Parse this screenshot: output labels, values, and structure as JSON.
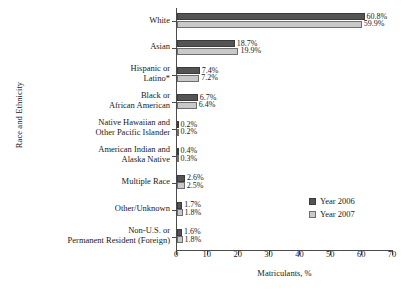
{
  "chart_data": {
    "type": "bar",
    "orientation": "horizontal",
    "title": "",
    "xlabel": "Matriculants, %",
    "ylabel": "Race and Ethnicity",
    "xlim": [
      0,
      70
    ],
    "xticks": [
      0,
      10,
      20,
      30,
      40,
      50,
      60,
      70
    ],
    "grid": false,
    "legend_position": "inside-right",
    "categories": [
      "White",
      "Asian",
      "Hispanic or\nLatino*",
      "Black or\nAfrican American",
      "Native Hawaiian and\nOther Pacific Islander",
      "American Indian and\nAlaska Native",
      "Multiple Race",
      "Other/Unknown",
      "Non-U.S. or\nPermanent Resident (Foreign)"
    ],
    "series": [
      {
        "name": "Year 2006",
        "color": "#545454",
        "values": [
          60.8,
          18.7,
          7.4,
          6.7,
          0.2,
          0.4,
          2.6,
          1.7,
          1.6
        ],
        "labels": [
          "60.8%",
          "18.7%",
          "7.4%",
          "6.7%",
          "0.2%",
          "0.4%",
          "2.6%",
          "1.7%",
          "1.6%"
        ]
      },
      {
        "name": "Year 2007",
        "color": "#c9c9c9",
        "values": [
          59.9,
          19.9,
          7.2,
          6.4,
          0.2,
          0.3,
          2.5,
          1.8,
          1.8
        ],
        "labels": [
          "59.9%",
          "19.9%",
          "7.2%",
          "6.4%",
          "0.2%",
          "0.3%",
          "2.5%",
          "1.8%",
          "1.8%"
        ]
      }
    ]
  },
  "legend": {
    "items": [
      {
        "label": "Year 2006"
      },
      {
        "label": "Year 2007"
      }
    ]
  },
  "axes": {
    "x_title": "Matriculants, %",
    "y_title": "Race and Ethnicity",
    "x_tick_labels": [
      "0",
      "10",
      "20",
      "30",
      "40",
      "50",
      "60",
      "70"
    ]
  }
}
